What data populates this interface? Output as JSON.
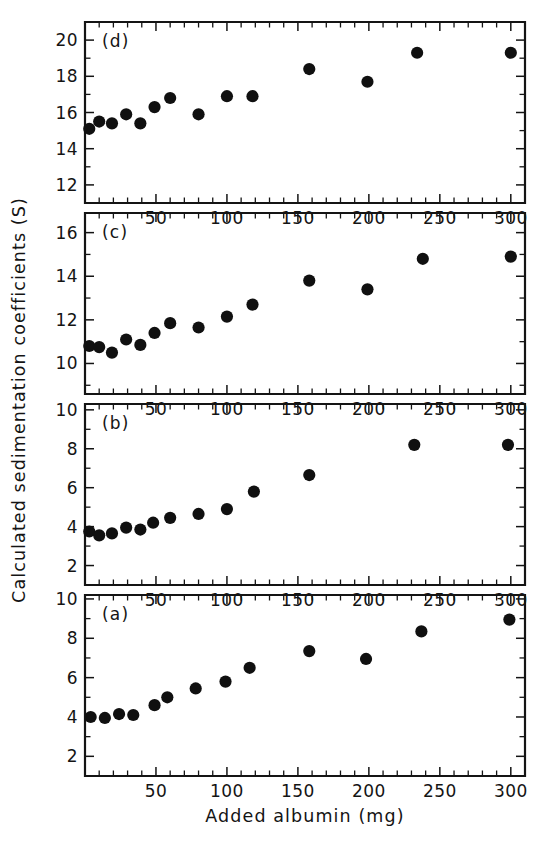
{
  "figure": {
    "background_color": "#ffffff",
    "ink_color": "#141414",
    "marker_color": "#101010",
    "x_axis_title": "Added albumin (mg)",
    "y_axis_title": "Calculated sedimentation coefficients (S)",
    "panel_labels": [
      "(a)",
      "(b)",
      "(c)",
      "(d)"
    ],
    "x_tick_labels": [
      "50",
      "100",
      "150",
      "200",
      "250",
      "300"
    ],
    "x_tick_values": [
      50,
      100,
      150,
      200,
      250,
      300
    ],
    "x_minor_step": 10,
    "panel_a_y_tick_labels": [
      "2",
      "4",
      "6",
      "8",
      "10"
    ],
    "panel_b_y_tick_labels": [
      "2",
      "4",
      "6",
      "8",
      "10"
    ],
    "panel_c_y_tick_labels": [
      "10",
      "12",
      "14",
      "16"
    ],
    "panel_d_y_tick_labels": [
      "12",
      "14",
      "16",
      "18",
      "20"
    ]
  },
  "chart_data": [
    {
      "id": "panel-d",
      "type": "scatter",
      "panel": "(d)",
      "title": "",
      "xlabel": "Added albumin (mg)",
      "ylabel": "Calculated sedimentation coefficients (S)",
      "xlim": [
        0,
        310
      ],
      "ylim": [
        11.0,
        21.0
      ],
      "xticks": [
        50,
        100,
        150,
        200,
        250,
        300
      ],
      "yticks": [
        12,
        14,
        16,
        18,
        20
      ],
      "grid": false,
      "legend": "none",
      "marker": "filled-circle",
      "x": [
        3,
        10,
        19,
        29,
        39,
        49,
        60,
        80,
        100,
        118,
        158,
        199,
        234,
        300
      ],
      "y": [
        15.1,
        15.5,
        15.4,
        15.9,
        15.4,
        16.3,
        16.8,
        15.9,
        16.9,
        16.9,
        18.4,
        17.7,
        19.3,
        19.3
      ]
    },
    {
      "id": "panel-c",
      "type": "scatter",
      "panel": "(c)",
      "title": "",
      "xlabel": "Added albumin (mg)",
      "ylabel": "Calculated sedimentation coefficients (S)",
      "xlim": [
        0,
        310
      ],
      "ylim": [
        8.6,
        16.9
      ],
      "xticks": [
        50,
        100,
        150,
        200,
        250,
        300
      ],
      "yticks": [
        10,
        12,
        14,
        16
      ],
      "grid": false,
      "legend": "none",
      "marker": "filled-circle",
      "x": [
        3,
        10,
        19,
        29,
        39,
        49,
        60,
        80,
        100,
        118,
        158,
        199,
        238,
        300
      ],
      "y": [
        10.8,
        10.75,
        10.5,
        11.1,
        10.85,
        11.4,
        11.85,
        11.65,
        12.15,
        12.7,
        13.8,
        13.4,
        14.8,
        14.9
      ]
    },
    {
      "id": "panel-b",
      "type": "scatter",
      "panel": "(b)",
      "title": "",
      "xlabel": "Added albumin (mg)",
      "ylabel": "Calculated sedimentation coefficients (S)",
      "xlim": [
        0,
        310
      ],
      "ylim": [
        1.0,
        10.3
      ],
      "xticks": [
        50,
        100,
        150,
        200,
        250,
        300
      ],
      "yticks": [
        2,
        4,
        6,
        8,
        10
      ],
      "grid": false,
      "legend": "none",
      "marker": "filled-circle",
      "x": [
        3,
        10,
        19,
        29,
        39,
        48,
        60,
        80,
        100,
        119,
        158,
        232,
        298
      ],
      "y": [
        3.75,
        3.55,
        3.65,
        3.95,
        3.85,
        4.2,
        4.45,
        4.65,
        4.9,
        5.8,
        6.65,
        8.2,
        8.2
      ]
    },
    {
      "id": "panel-a",
      "type": "scatter",
      "panel": "(a)",
      "title": "",
      "xlabel": "Added albumin (mg)",
      "ylabel": "Calculated sedimentation coefficients (S)",
      "xlim": [
        0,
        310
      ],
      "ylim": [
        1.0,
        10.2
      ],
      "xticks": [
        50,
        100,
        150,
        200,
        250,
        300
      ],
      "yticks": [
        2,
        4,
        6,
        8,
        10
      ],
      "grid": false,
      "legend": "none",
      "marker": "filled-circle",
      "x": [
        4,
        14,
        24,
        34,
        49,
        58,
        78,
        99,
        116,
        158,
        198,
        237,
        299
      ],
      "y": [
        4.0,
        3.95,
        4.15,
        4.1,
        4.6,
        5.0,
        5.45,
        5.8,
        6.5,
        7.35,
        6.95,
        8.35,
        8.95
      ]
    }
  ]
}
